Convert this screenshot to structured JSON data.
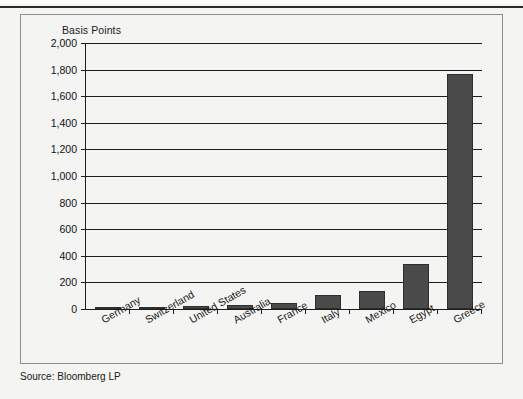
{
  "page": {
    "background_color": "#f4f4f2",
    "source_note": "Source: Bloomberg LP"
  },
  "chart_data": {
    "type": "bar",
    "title": "",
    "ylabel": "Basis Points",
    "xlabel": "",
    "ylim": [
      0,
      2000
    ],
    "ytick_step": 200,
    "grid": true,
    "legend": null,
    "bar_color": "#4a4a4a",
    "categories": [
      "Germany",
      "Switzerland",
      "United States",
      "Australia",
      "France",
      "Italy",
      "Mexico",
      "Egypt",
      "Greece"
    ],
    "values": [
      10,
      18,
      25,
      33,
      42,
      105,
      135,
      340,
      1770
    ],
    "ytick_labels": [
      "2,000",
      "1,800",
      "1,600",
      "1,400",
      "1,200",
      "1,000",
      "800",
      "600",
      "400",
      "200",
      "0"
    ],
    "ytick_values": [
      2000,
      1800,
      1600,
      1400,
      1200,
      1000,
      800,
      600,
      400,
      200,
      0
    ]
  }
}
